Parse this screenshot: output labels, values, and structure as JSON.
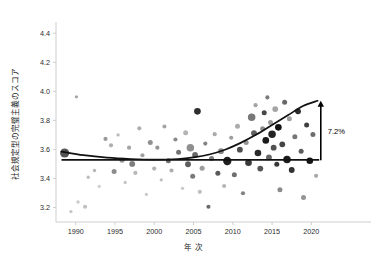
{
  "chart_data": {
    "type": "scatter",
    "title": "",
    "subtitle": "",
    "xlabel": "年 次",
    "ylabel": "社会規定型の完璧主義のスコア",
    "xlim": [
      1987.5,
      2022.5
    ],
    "ylim": [
      3.1,
      4.45
    ],
    "grid": false,
    "legend": null,
    "xticks": [
      1990,
      1995,
      2000,
      2005,
      2010,
      2015,
      2020
    ],
    "xtick_labels": [
      "1990",
      "1995",
      "2000",
      "2005",
      "2010",
      "2015",
      "2020"
    ],
    "yticks": [
      3.2,
      3.4,
      3.6,
      3.8,
      4.0,
      4.2,
      4.4
    ],
    "ytick_labels": [
      "3.2",
      "3.4",
      "3.6",
      "3.8",
      "4.0",
      "4.2",
      "4.4"
    ],
    "annotations": [
      {
        "name": "increase-annotation",
        "text": "7.2%",
        "x": 2021.2,
        "y_from": 3.525,
        "y_to": 3.935,
        "arrow": "up"
      }
    ],
    "series": [
      {
        "name": "flat-reference-line",
        "type": "line",
        "color": "#111111",
        "x": [
          1988.2,
          2021.0
        ],
        "values": [
          3.528,
          3.528
        ]
      },
      {
        "name": "fitted-trend-curve",
        "type": "line",
        "color": "#111111",
        "x": [
          1988.2,
          1991,
          1994,
          1997,
          2000,
          2003,
          2005,
          2007,
          2009,
          2011,
          2013,
          2015,
          2017,
          2019,
          2020.8
        ],
        "values": [
          3.585,
          3.56,
          3.543,
          3.534,
          3.53,
          3.534,
          3.545,
          3.565,
          3.598,
          3.645,
          3.702,
          3.768,
          3.835,
          3.9,
          3.935
        ]
      },
      {
        "name": "study-samples",
        "type": "scatter",
        "points": [
          {
            "x": 1988.6,
            "y": 3.575,
            "size": 11,
            "shade": "#555555"
          },
          {
            "x": 1989.4,
            "y": 3.172,
            "size": 4,
            "shade": "#c4c4c4"
          },
          {
            "x": 1990.3,
            "y": 3.238,
            "size": 4,
            "shade": "#c9c9c9"
          },
          {
            "x": 1990.1,
            "y": 3.962,
            "size": 4,
            "shade": "#a8a8a8"
          },
          {
            "x": 1991.2,
            "y": 3.205,
            "size": 5,
            "shade": "#c0c0c0"
          },
          {
            "x": 1991.6,
            "y": 3.408,
            "size": 4,
            "shade": "#bdbdbd"
          },
          {
            "x": 1992.4,
            "y": 3.455,
            "size": 4,
            "shade": "#b5b5b5"
          },
          {
            "x": 1993.0,
            "y": 3.345,
            "size": 4,
            "shade": "#cfcfcf"
          },
          {
            "x": 1993.8,
            "y": 3.672,
            "size": 5,
            "shade": "#9a9a9a"
          },
          {
            "x": 1994.5,
            "y": 3.628,
            "size": 5,
            "shade": "#b0b0b0"
          },
          {
            "x": 1994.9,
            "y": 3.448,
            "size": 6,
            "shade": "#8c8c8c"
          },
          {
            "x": 1995.4,
            "y": 3.7,
            "size": 4,
            "shade": "#bababa"
          },
          {
            "x": 1995.9,
            "y": 3.525,
            "size": 6,
            "shade": "#999999"
          },
          {
            "x": 1996.3,
            "y": 3.372,
            "size": 4,
            "shade": "#c6c6c6"
          },
          {
            "x": 1996.8,
            "y": 3.612,
            "size": 5,
            "shade": "#a4a4a4"
          },
          {
            "x": 1997.2,
            "y": 3.5,
            "size": 7,
            "shade": "#7e7e7e"
          },
          {
            "x": 1997.6,
            "y": 3.438,
            "size": 5,
            "shade": "#b8b8b8"
          },
          {
            "x": 1998.1,
            "y": 3.745,
            "size": 5,
            "shade": "#aeaeae"
          },
          {
            "x": 1998.5,
            "y": 3.56,
            "size": 5,
            "shade": "#a0a0a0"
          },
          {
            "x": 1999.0,
            "y": 3.29,
            "size": 4,
            "shade": "#cbcbcb"
          },
          {
            "x": 1999.5,
            "y": 3.648,
            "size": 6,
            "shade": "#909090"
          },
          {
            "x": 2000.0,
            "y": 3.468,
            "size": 5,
            "shade": "#b2b2b2"
          },
          {
            "x": 2000.4,
            "y": 3.612,
            "size": 5,
            "shade": "#959595"
          },
          {
            "x": 2000.9,
            "y": 3.39,
            "size": 4,
            "shade": "#c2c2c2"
          },
          {
            "x": 2001.3,
            "y": 3.758,
            "size": 5,
            "shade": "#a6a6a6"
          },
          {
            "x": 2001.8,
            "y": 3.522,
            "size": 6,
            "shade": "#6f6f6f"
          },
          {
            "x": 2002.2,
            "y": 3.455,
            "size": 5,
            "shade": "#adadad"
          },
          {
            "x": 2002.7,
            "y": 3.668,
            "size": 5,
            "shade": "#8a8a8a"
          },
          {
            "x": 2003.1,
            "y": 3.58,
            "size": 6,
            "shade": "#747474"
          },
          {
            "x": 2003.6,
            "y": 3.332,
            "size": 4,
            "shade": "#c8c8c8"
          },
          {
            "x": 2004.0,
            "y": 3.715,
            "size": 6,
            "shade": "#b4b4b4"
          },
          {
            "x": 2004.3,
            "y": 3.498,
            "size": 7,
            "shade": "#5e5e5e"
          },
          {
            "x": 2004.6,
            "y": 3.612,
            "size": 9,
            "shade": "#8f8f8f"
          },
          {
            "x": 2004.9,
            "y": 3.415,
            "size": 6,
            "shade": "#7a7a7a"
          },
          {
            "x": 2005.2,
            "y": 3.562,
            "size": 7,
            "shade": "#6a6a6a"
          },
          {
            "x": 2005.5,
            "y": 3.862,
            "size": 8,
            "shade": "#2e2e2e"
          },
          {
            "x": 2005.8,
            "y": 3.308,
            "size": 5,
            "shade": "#bfbfbf"
          },
          {
            "x": 2006.1,
            "y": 3.47,
            "size": 6,
            "shade": "#9c9c9c"
          },
          {
            "x": 2006.5,
            "y": 3.64,
            "size": 5,
            "shade": "#858585"
          },
          {
            "x": 2006.9,
            "y": 3.205,
            "size": 5,
            "shade": "#6b6b6b"
          },
          {
            "x": 2007.3,
            "y": 3.538,
            "size": 6,
            "shade": "#7c7c7c"
          },
          {
            "x": 2007.7,
            "y": 3.705,
            "size": 5,
            "shade": "#aaaaaa"
          },
          {
            "x": 2008.1,
            "y": 3.435,
            "size": 6,
            "shade": "#5a5a5a"
          },
          {
            "x": 2008.5,
            "y": 3.588,
            "size": 7,
            "shade": "#888888"
          },
          {
            "x": 2008.9,
            "y": 3.348,
            "size": 5,
            "shade": "#b6b6b6"
          },
          {
            "x": 2009.3,
            "y": 3.52,
            "size": 10,
            "shade": "#1f1f1f"
          },
          {
            "x": 2009.8,
            "y": 3.68,
            "size": 5,
            "shade": "#9e9e9e"
          },
          {
            "x": 2010.2,
            "y": 3.425,
            "size": 6,
            "shade": "#707070"
          },
          {
            "x": 2010.6,
            "y": 3.76,
            "size": 6,
            "shade": "#acacac"
          },
          {
            "x": 2010.9,
            "y": 3.598,
            "size": 7,
            "shade": "#4d4d4d"
          },
          {
            "x": 2011.3,
            "y": 3.298,
            "size": 5,
            "shade": "#818181"
          },
          {
            "x": 2011.7,
            "y": 3.648,
            "size": 6,
            "shade": "#939393"
          },
          {
            "x": 2012.0,
            "y": 3.508,
            "size": 8,
            "shade": "#3a3a3a"
          },
          {
            "x": 2012.4,
            "y": 3.822,
            "size": 9,
            "shade": "#787878"
          },
          {
            "x": 2012.7,
            "y": 3.712,
            "size": 7,
            "shade": "#606060"
          },
          {
            "x": 2012.9,
            "y": 3.905,
            "size": 5,
            "shade": "#a2a2a2"
          },
          {
            "x": 2013.2,
            "y": 3.575,
            "size": 8,
            "shade": "#2a2a2a"
          },
          {
            "x": 2013.5,
            "y": 3.468,
            "size": 7,
            "shade": "#555555"
          },
          {
            "x": 2013.8,
            "y": 3.742,
            "size": 6,
            "shade": "#8d8d8d"
          },
          {
            "x": 2014.0,
            "y": 3.852,
            "size": 6,
            "shade": "#474747"
          },
          {
            "x": 2014.2,
            "y": 3.662,
            "size": 8,
            "shade": "#1a1a1a"
          },
          {
            "x": 2014.4,
            "y": 3.958,
            "size": 5,
            "shade": "#7b7b7b"
          },
          {
            "x": 2014.6,
            "y": 3.545,
            "size": 7,
            "shade": "#666666"
          },
          {
            "x": 2014.8,
            "y": 3.785,
            "size": 6,
            "shade": "#9b9b9b"
          },
          {
            "x": 2015.0,
            "y": 3.705,
            "size": 9,
            "shade": "#242424"
          },
          {
            "x": 2015.2,
            "y": 3.612,
            "size": 7,
            "shade": "#505050"
          },
          {
            "x": 2015.4,
            "y": 3.878,
            "size": 7,
            "shade": "#a5a5a5"
          },
          {
            "x": 2015.6,
            "y": 3.498,
            "size": 6,
            "shade": "#383838"
          },
          {
            "x": 2015.8,
            "y": 3.752,
            "size": 8,
            "shade": "#121212"
          },
          {
            "x": 2016.0,
            "y": 3.322,
            "size": 6,
            "shade": "#8b8b8b"
          },
          {
            "x": 2016.3,
            "y": 3.635,
            "size": 7,
            "shade": "#444444"
          },
          {
            "x": 2016.6,
            "y": 3.925,
            "size": 6,
            "shade": "#696969"
          },
          {
            "x": 2016.9,
            "y": 3.53,
            "size": 9,
            "shade": "#1c1c1c"
          },
          {
            "x": 2017.2,
            "y": 3.812,
            "size": 6,
            "shade": "#9f9f9f"
          },
          {
            "x": 2017.5,
            "y": 3.458,
            "size": 7,
            "shade": "#313131"
          },
          {
            "x": 2017.9,
            "y": 3.688,
            "size": 6,
            "shade": "#767676"
          },
          {
            "x": 2018.3,
            "y": 3.862,
            "size": 7,
            "shade": "#2d2d2d"
          },
          {
            "x": 2018.7,
            "y": 3.588,
            "size": 6,
            "shade": "#5c5c5c"
          },
          {
            "x": 2019.0,
            "y": 3.268,
            "size": 6,
            "shade": "#949494"
          },
          {
            "x": 2019.4,
            "y": 3.768,
            "size": 6,
            "shade": "#3f3f3f"
          },
          {
            "x": 2019.8,
            "y": 3.522,
            "size": 8,
            "shade": "#161616"
          },
          {
            "x": 2020.2,
            "y": 3.702,
            "size": 6,
            "shade": "#6d6d6d"
          },
          {
            "x": 2020.6,
            "y": 3.418,
            "size": 5,
            "shade": "#a9a9a9"
          }
        ]
      }
    ]
  }
}
